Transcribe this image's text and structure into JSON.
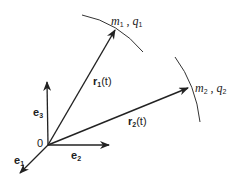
{
  "figure": {
    "origin_label": "0",
    "basis": {
      "e1": {
        "base": "e",
        "sub": "1"
      },
      "e2": {
        "base": "e",
        "sub": "2"
      },
      "e3": {
        "base": "e",
        "sub": "3"
      }
    },
    "vectors": {
      "r1": {
        "base": "r",
        "sub": "1",
        "arg": "(t)"
      },
      "r2": {
        "base": "r",
        "sub": "2",
        "arg": "(t)"
      }
    },
    "particles": {
      "p1": {
        "m": "m",
        "m_sub": "1",
        "sep": " , ",
        "q": "q",
        "q_sub": "1"
      },
      "p2": {
        "m": "m",
        "m_sub": "2",
        "sep": " , ",
        "q": "q",
        "q_sub": "2"
      }
    },
    "colors": {
      "stroke": "#222222",
      "background": "#ffffff"
    }
  }
}
